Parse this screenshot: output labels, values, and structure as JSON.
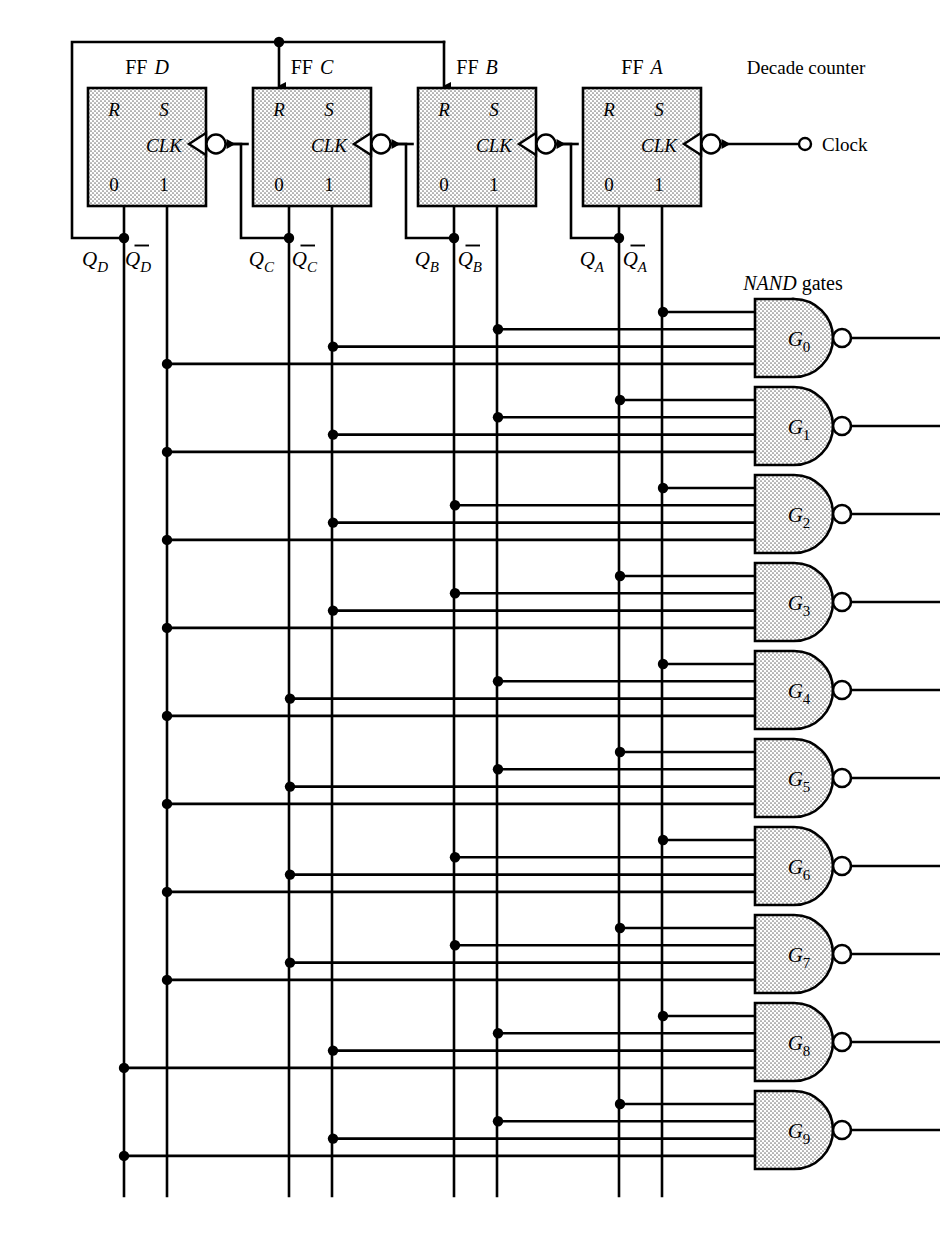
{
  "diagram": {
    "title_note": "Decade counter",
    "gates_note_italic": "NAND",
    "gates_note_roman": " gates",
    "clock_label": "Clock"
  },
  "flipflops": [
    {
      "name": "FF",
      "id": "D",
      "pin_r": "R",
      "pin_s": "S",
      "pin_clk": "CLK",
      "pin_0": "0",
      "pin_1": "1",
      "q": "Q",
      "qsub": "D",
      "x": 88
    },
    {
      "name": "FF",
      "id": "C",
      "pin_r": "R",
      "pin_s": "S",
      "pin_clk": "CLK",
      "pin_0": "0",
      "pin_1": "1",
      "q": "Q",
      "qsub": "C",
      "x": 253
    },
    {
      "name": "FF",
      "id": "B",
      "pin_r": "R",
      "pin_s": "S",
      "pin_clk": "CLK",
      "pin_0": "0",
      "pin_1": "1",
      "q": "Q",
      "qsub": "B",
      "x": 418
    },
    {
      "name": "FF",
      "id": "A",
      "pin_r": "R",
      "pin_s": "S",
      "pin_clk": "CLK",
      "pin_0": "0",
      "pin_1": "1",
      "q": "Q",
      "qsub": "A",
      "x": 583
    }
  ],
  "buses": [
    {
      "label": "Q",
      "sub": "D",
      "bar": false,
      "x": 124
    },
    {
      "label": "Q",
      "sub": "D",
      "bar": true,
      "x": 167
    },
    {
      "label": "Q",
      "sub": "C",
      "bar": false,
      "x": 290
    },
    {
      "label": "Q",
      "sub": "C",
      "bar": true,
      "x": 333
    },
    {
      "label": "Q",
      "sub": "B",
      "bar": false,
      "x": 455
    },
    {
      "label": "Q",
      "sub": "B",
      "bar": true,
      "x": 498
    },
    {
      "label": "Q",
      "sub": "A",
      "bar": false,
      "x": 620
    },
    {
      "label": "Q",
      "sub": "A",
      "bar": true,
      "x": 663
    }
  ],
  "gates": [
    {
      "label": "G",
      "sub": "0",
      "y": 338,
      "inputs": [
        "QDbar",
        "QCbar",
        "QBbar",
        "QAbar"
      ]
    },
    {
      "label": "G",
      "sub": "1",
      "y": 426,
      "inputs": [
        "QDbar",
        "QCbar",
        "QBbar",
        "QA"
      ]
    },
    {
      "label": "G",
      "sub": "2",
      "y": 514,
      "inputs": [
        "QDbar",
        "QCbar",
        "QB",
        "QAbar"
      ]
    },
    {
      "label": "G",
      "sub": "3",
      "y": 602,
      "inputs": [
        "QDbar",
        "QCbar",
        "QB",
        "QA"
      ]
    },
    {
      "label": "G",
      "sub": "4",
      "y": 690,
      "inputs": [
        "QDbar",
        "QC",
        "QBbar",
        "QAbar"
      ]
    },
    {
      "label": "G",
      "sub": "5",
      "y": 778,
      "inputs": [
        "QDbar",
        "QC",
        "QBbar",
        "QA"
      ]
    },
    {
      "label": "G",
      "sub": "6",
      "y": 866,
      "inputs": [
        "QDbar",
        "QC",
        "QB",
        "QAbar"
      ]
    },
    {
      "label": "G",
      "sub": "7",
      "y": 954,
      "inputs": [
        "QDbar",
        "QC",
        "QB",
        "QA"
      ]
    },
    {
      "label": "G",
      "sub": "8",
      "y": 1042,
      "inputs": [
        "QD",
        "QCbar",
        "QBbar",
        "QAbar"
      ]
    },
    {
      "label": "G",
      "sub": "9",
      "y": 1130,
      "inputs": [
        "QD",
        "QCbar",
        "QBbar",
        "QA"
      ]
    }
  ],
  "colors": {
    "line": "#000000",
    "fill_stipple": "#d9d9d9",
    "background": "#ffffff"
  }
}
